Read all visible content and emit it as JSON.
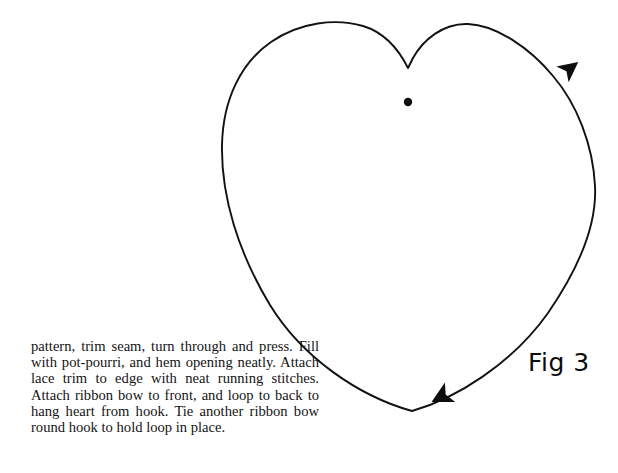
{
  "page": {
    "background_color": "#ffffff",
    "ink_color": "#111111",
    "width": 618,
    "height": 473
  },
  "figure": {
    "name": "heart-shape-diagram",
    "caption": "Fig 3",
    "stroke_color": "#111111",
    "stroke_width": 1.9,
    "center_dot": {
      "label": "centre-dot-marker",
      "cx": 408,
      "cy": 102,
      "r": 4.2,
      "fill": "#0d0d0d"
    },
    "arrows": [
      {
        "label": "upper-right-direction-arrow",
        "x": 568,
        "y": 70,
        "rotation_deg": -38,
        "fill": "#0d0d0d"
      },
      {
        "label": "lower-left-direction-arrow",
        "x": 443,
        "y": 396,
        "rotation_deg": 152,
        "fill": "#0d0d0d"
      }
    ],
    "outline_points": {
      "cleft_top": [
        408,
        68
      ],
      "left_lobe_peak": [
        330,
        24
      ],
      "left_extreme": [
        222,
        162
      ],
      "bottom_point": [
        412,
        411
      ],
      "right_extreme": [
        595,
        205
      ],
      "right_lobe_peak": [
        486,
        24
      ]
    }
  },
  "instructions": {
    "name": "pattern-instructions",
    "paragraph": "pattern, trim seam, turn through and press. Fill with pot-pourri, and hem opening neatly. Attach lace trim to edge with neat running stitches. Attach ribbon bow to front, and loop to back to hang heart from hook. Tie another ribbon bow round hook to hold loop in place.",
    "lines": [
      "pattern, trim seam, turn through and press.",
      "Fill with pot-pourri, and hem opening",
      "neatly. Attach lace trim to edge with neat",
      "running stitches. Attach ribbon bow to",
      "front, and loop to back to hang heart from",
      "hook. Tie another ribbon bow round hook",
      "to hold loop in place."
    ]
  }
}
